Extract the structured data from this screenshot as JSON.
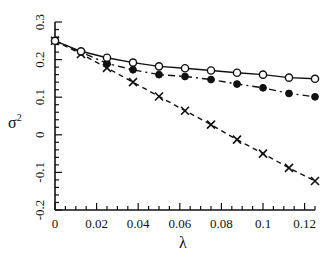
{
  "chart_data": {
    "type": "line",
    "title": "",
    "xlabel": "λ",
    "ylabel": "σ²",
    "xlim": [
      0,
      0.125
    ],
    "ylim": [
      -0.2,
      0.3
    ],
    "grid": false,
    "legend": null,
    "x_ticks": [
      0,
      0.02,
      0.04,
      0.06,
      0.08,
      0.1,
      0.12
    ],
    "x_tick_labels": [
      "0",
      "0.02",
      "0.04",
      "0.06",
      "0.08",
      "0.1",
      "0.12"
    ],
    "y_ticks": [
      -0.2,
      -0.1,
      0,
      0.1,
      0.2,
      0.3
    ],
    "y_tick_labels": [
      "-0.2",
      "-0.1",
      "0",
      "0.1",
      "0.2",
      "0.3"
    ],
    "x": [
      0,
      0.0125,
      0.025,
      0.0375,
      0.05,
      0.0625,
      0.075,
      0.0875,
      0.1,
      0.1125,
      0.125
    ],
    "series": [
      {
        "name": "open circles (solid line)",
        "marker": "open-circle",
        "line": "solid",
        "values": [
          0.25,
          0.222,
          0.205,
          0.192,
          0.182,
          0.177,
          0.171,
          0.165,
          0.16,
          0.152,
          0.149
        ]
      },
      {
        "name": "filled circles (dash-dot line)",
        "marker": "filled-circle",
        "line": "dashdot",
        "values": [
          0.25,
          0.22,
          0.19,
          0.173,
          0.16,
          0.155,
          0.147,
          0.135,
          0.125,
          0.11,
          0.101
        ]
      },
      {
        "name": "crosses (dashed line)",
        "marker": "cross",
        "line": "dashed",
        "values": [
          0.25,
          0.215,
          0.178,
          0.14,
          0.102,
          0.064,
          0.027,
          -0.013,
          -0.05,
          -0.088,
          -0.123
        ]
      }
    ]
  },
  "axes": {
    "x_label": "λ",
    "y_label_base": "σ",
    "y_label_sup": "2"
  }
}
